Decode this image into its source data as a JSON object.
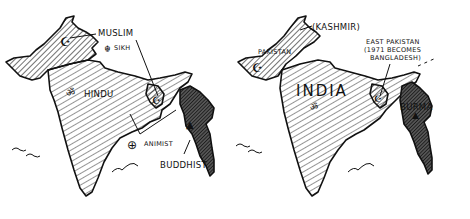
{
  "colors": {
    "ink": "#111111",
    "paper": "#ffffff",
    "buddhist_fill": "#333333"
  },
  "maps": [
    {
      "id": "religions",
      "labels": {
        "muslim": "MUSLIM",
        "sikh": "SIKH",
        "hindu": "HINDU",
        "animist": "ANIMIST",
        "buddhist": "BUDDHIST"
      },
      "symbols": [
        {
          "name": "crescent-icon",
          "glyph": "☪",
          "meaning": "Muslim"
        },
        {
          "name": "khanda-icon",
          "glyph": "☬",
          "meaning": "Sikh"
        },
        {
          "name": "om-icon",
          "glyph": "ॐ",
          "meaning": "Hindu"
        },
        {
          "name": "animist-icon",
          "glyph": "⊕",
          "meaning": "Animist"
        },
        {
          "name": "stupa-icon",
          "glyph": "▲",
          "meaning": "Buddhist"
        }
      ]
    },
    {
      "id": "partition",
      "labels": {
        "kashmir": "(KASHMIR)",
        "pakistan": "PAKISTAN",
        "india": "INDIA",
        "east_pakistan_line1": "EAST PAKISTAN",
        "east_pakistan_line2": "(1971 BECOMES",
        "east_pakistan_line3": "BANGLADESH)",
        "burma": "BURMA"
      }
    }
  ]
}
